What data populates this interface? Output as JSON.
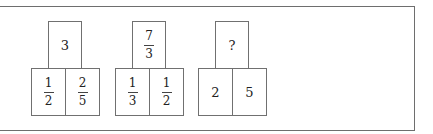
{
  "diagram": {
    "type": "number-puzzle",
    "groups": [
      {
        "top": {
          "kind": "integer",
          "value": "3"
        },
        "bottom": [
          {
            "kind": "fraction",
            "numerator": "1",
            "denominator": "2"
          },
          {
            "kind": "fraction",
            "numerator": "2",
            "denominator": "5"
          }
        ]
      },
      {
        "top": {
          "kind": "fraction",
          "numerator": "7",
          "denominator": "3"
        },
        "bottom": [
          {
            "kind": "fraction",
            "numerator": "1",
            "denominator": "3"
          },
          {
            "kind": "fraction",
            "numerator": "1",
            "denominator": "2"
          }
        ]
      },
      {
        "top": {
          "kind": "unknown",
          "value": "?"
        },
        "bottom": [
          {
            "kind": "integer",
            "value": "2"
          },
          {
            "kind": "integer",
            "value": "5"
          }
        ]
      }
    ]
  }
}
